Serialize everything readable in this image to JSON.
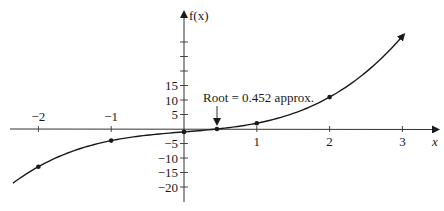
{
  "chart_data": {
    "type": "line",
    "title": "",
    "xlabel": "x",
    "ylabel": "f(x)",
    "function_hint": "f(x) = x^3 + 2x - 1",
    "x_ticks": [
      -2,
      -1,
      1,
      2,
      3
    ],
    "x_tick_labels": [
      "−2",
      "−1",
      "1",
      "2",
      "3"
    ],
    "y_ticks": [
      15,
      10,
      5,
      -5,
      -10,
      -15,
      -20
    ],
    "y_tick_labels": [
      "15",
      "10",
      "5",
      "−5",
      "−10",
      "−15",
      "−20"
    ],
    "y_unlabeled_ticks": [
      20,
      25,
      30
    ],
    "xlim": [
      -2.4,
      3.5
    ],
    "ylim": [
      -25,
      40
    ],
    "grid": false,
    "legend": null,
    "series": [
      {
        "name": "f(x)",
        "points": [
          {
            "x": -2,
            "y": -13
          },
          {
            "x": -1,
            "y": -4
          },
          {
            "x": 0,
            "y": -1
          },
          {
            "x": 0.452,
            "y": 0
          },
          {
            "x": 1,
            "y": 2
          },
          {
            "x": 2,
            "y": 11
          }
        ],
        "curve_range": [
          -2.35,
          3.02
        ]
      }
    ],
    "annotations": [
      {
        "text": "Root = 0.452 approx.",
        "x": 0.452,
        "y": 0,
        "arrow": true
      }
    ]
  },
  "labels": {
    "y_axis": "f(x)",
    "x_axis": "x",
    "root_annotation": "Root = 0.452 approx."
  }
}
